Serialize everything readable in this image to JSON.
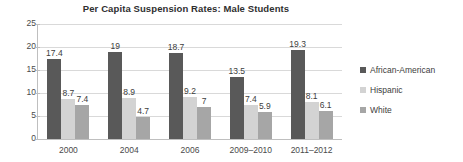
{
  "chart_data": {
    "type": "bar",
    "title": "Per Capita Suspension Rates: Male Students",
    "xlabel": "",
    "ylabel": "",
    "ylim": [
      0,
      25
    ],
    "yticks": [
      0,
      5,
      10,
      15,
      20,
      25
    ],
    "grid": true,
    "legend_position": "right",
    "categories": [
      "2000",
      "2004",
      "2006",
      "2009–2010",
      "2011–2012"
    ],
    "series": [
      {
        "name": "African-American",
        "color": "#595959",
        "values": [
          17.4,
          19,
          18.7,
          13.5,
          19.3
        ],
        "labels": [
          "17.4",
          "19",
          "18.7",
          "13.5",
          "19.3"
        ]
      },
      {
        "name": "Hispanic",
        "color": "#d3d3d3",
        "values": [
          8.7,
          8.9,
          9.2,
          7.4,
          8.1
        ],
        "labels": [
          "8.7",
          "8.9",
          "9.2",
          "7.4",
          "8.1"
        ]
      },
      {
        "name": "White",
        "color": "#a6a6a6",
        "values": [
          7.4,
          4.7,
          7,
          5.9,
          6.1
        ],
        "labels": [
          "7.4",
          "4.7",
          "7",
          "5.9",
          "6.1"
        ]
      }
    ]
  },
  "axis": {
    "y_tick_labels": [
      "25",
      "20",
      "15",
      "10",
      "5",
      "0"
    ]
  },
  "legend": {
    "items": [
      {
        "label": "African-American",
        "color": "#595959"
      },
      {
        "label": "Hispanic",
        "color": "#d3d3d3"
      },
      {
        "label": "White",
        "color": "#a6a6a6"
      }
    ]
  }
}
